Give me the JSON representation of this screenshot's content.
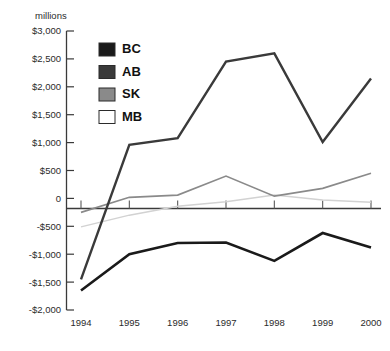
{
  "chart_data": {
    "type": "line",
    "title": "",
    "subtitle": "",
    "units_label": "millions",
    "xlabel": "",
    "ylabel": "",
    "x": [
      1994,
      1995,
      1996,
      1997,
      1998,
      1999,
      2000
    ],
    "categories": [
      "1994",
      "1995",
      "1996",
      "1997",
      "1998",
      "1999",
      "2000"
    ],
    "xtick_labels": [
      "1994",
      "1995",
      "1996",
      "1997",
      "1998",
      "1999",
      "2000"
    ],
    "ytick_labels": [
      "$3,000",
      "$2,500",
      "$2,000",
      "$1,500",
      "$1,000",
      "$500",
      "0",
      "-$500",
      "-$1,000",
      "-$1,500",
      "-$2,000"
    ],
    "ytick_values": [
      3000,
      2500,
      2000,
      1500,
      1000,
      500,
      0,
      -500,
      -1000,
      -1500,
      -2000
    ],
    "ylim": [
      -2000,
      3000
    ],
    "xlim": [
      1994,
      2000
    ],
    "grid": false,
    "legend_position": "upper-left-inside",
    "series": [
      {
        "name": "BC",
        "label": "BC",
        "color": "#1a1a1a",
        "width": 2.6,
        "values": [
          -1650,
          -1000,
          -800,
          -790,
          -1120,
          -620,
          -880
        ]
      },
      {
        "name": "AB",
        "label": "AB",
        "color": "#3a3a3a",
        "width": 2.4,
        "values": [
          -1450,
          960,
          1080,
          2450,
          2600,
          1010,
          2150
        ]
      },
      {
        "name": "SK",
        "label": "SK",
        "color": "#8a8a8a",
        "width": 1.7,
        "values": [
          -250,
          20,
          60,
          400,
          40,
          180,
          450
        ]
      },
      {
        "name": "MB",
        "label": "MB",
        "color": "#d2d2d2",
        "width": 1.5,
        "values": [
          -510,
          -300,
          -140,
          -60,
          60,
          -30,
          -70
        ]
      }
    ],
    "legend_entries": [
      {
        "label": "BC",
        "color": "#1a1a1a"
      },
      {
        "label": "AB",
        "color": "#3a3a3a"
      },
      {
        "label": "SK",
        "color": "#8a8a8a"
      },
      {
        "label": "MB",
        "color": "#ffffff"
      }
    ]
  }
}
